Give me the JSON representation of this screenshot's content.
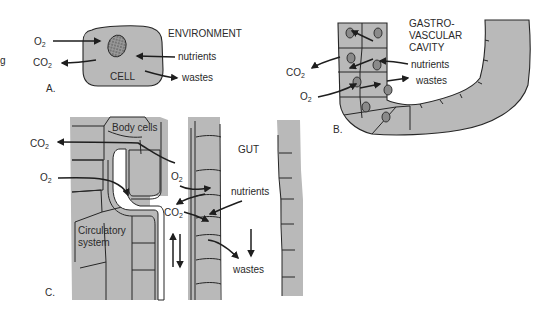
{
  "figure": {
    "edge_fragment_text": "g",
    "fill_color": "#b9b9b9",
    "line_color": "#1e1e1e"
  },
  "panel_a": {
    "label": "A.",
    "cell_label": "CELL",
    "environment_label": "ENVIRONMENT",
    "arrows": [
      {
        "label": "O",
        "sub": "2",
        "direction": "in"
      },
      {
        "label": "CO",
        "sub": "2",
        "direction": "out"
      },
      {
        "label": "nutrients",
        "direction": "in"
      },
      {
        "label": "wastes",
        "direction": "out"
      }
    ]
  },
  "panel_b": {
    "label": "B.",
    "cavity_label_lines": [
      "GASTRO-",
      "VASCULAR",
      "CAVITY"
    ],
    "arrows": [
      {
        "label": "CO",
        "sub": "2",
        "direction": "out"
      },
      {
        "label": "O",
        "sub": "2",
        "direction": "in"
      },
      {
        "label": "nutrients",
        "direction": "in"
      },
      {
        "label": "wastes",
        "direction": "out"
      }
    ]
  },
  "panel_c": {
    "label": "C.",
    "body_cells_label": "Body cells",
    "gut_label": "GUT",
    "circulatory_label_lines": [
      "Circulatory",
      "system"
    ],
    "arrows": [
      {
        "label": "CO",
        "sub": "2",
        "position": "left-top"
      },
      {
        "label": "O",
        "sub": "2",
        "position": "left-middle"
      },
      {
        "label": "O",
        "sub": "2",
        "position": "gut-wall"
      },
      {
        "label": "CO",
        "sub": "2",
        "position": "gut-wall"
      },
      {
        "label": "nutrients",
        "direction": "in"
      },
      {
        "label": "wastes",
        "direction": "out"
      }
    ]
  }
}
